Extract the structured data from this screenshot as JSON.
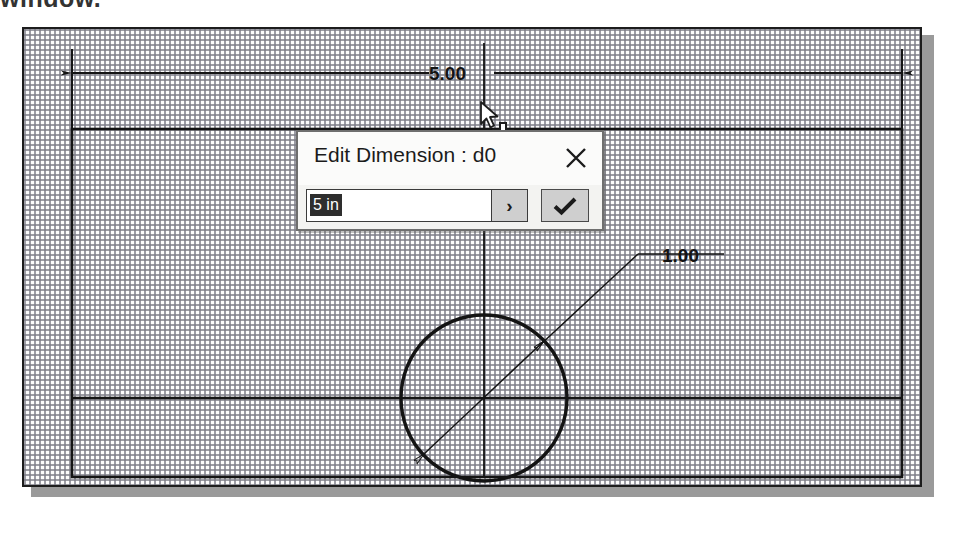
{
  "top_caption": "window.",
  "canvas": {
    "name": "sketch-graphics-window",
    "background_color": "#fbfbfb",
    "border_color": "#1d1d1d",
    "shadow_color": "#9a9a9a",
    "grid_color": "#7d7d87"
  },
  "sketch": {
    "geometry_color": "#141414",
    "dimension_color": "#141414",
    "rectangle": {
      "label": "rectangle-profile",
      "x": 48,
      "y": 100,
      "width": 830,
      "height": 348
    },
    "circle": {
      "label": "circle-profile",
      "cx": 460,
      "cy": 369,
      "r": 83
    },
    "centerline_horizontal_y": 369,
    "centerline_vertical_x": 460
  },
  "dimensions": [
    {
      "name": "horizontal-width-dimension",
      "value_label": "5.00",
      "type": "linear",
      "orientation": "horizontal"
    },
    {
      "name": "circle-diameter-dimension",
      "value_label": "1.00",
      "type": "diameter",
      "orientation": "diagonal"
    }
  ],
  "dialog": {
    "name": "edit-dimension-dialog",
    "title": "Edit Dimension : d0",
    "close_label": "✕",
    "value_field": {
      "value": "5 in",
      "placeholder": "5 in",
      "selected": true
    },
    "expand_button_label": "›",
    "accept_button_label": "✓",
    "accept_button_color": "#cfcfcf",
    "background_color": "#f3f3f1",
    "titlebar_color": "#fbfbfa",
    "border_color": "#6f6f6f"
  },
  "cursors": {
    "pointer": "mouse-pointer-arrow",
    "crosshair": "dimension-crosshair"
  }
}
